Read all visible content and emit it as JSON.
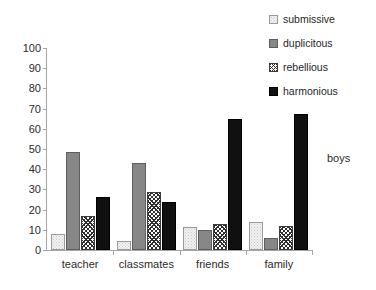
{
  "chart_data": {
    "type": "bar",
    "title": "",
    "xlabel": "",
    "ylabel": "",
    "ylim": [
      0,
      100
    ],
    "yticks": [
      0,
      10,
      20,
      30,
      40,
      50,
      60,
      70,
      80,
      90,
      100
    ],
    "grid": false,
    "legend_position": "top-right",
    "annotation": "boys",
    "categories": [
      "teacher",
      "classmates",
      "friends",
      "family"
    ],
    "series": [
      {
        "name": "submissive",
        "values": [
          8,
          4.5,
          11.5,
          14
        ],
        "color": "#f2f2f2",
        "pattern": "dotted"
      },
      {
        "name": "duplicitous",
        "values": [
          48.5,
          43,
          10,
          6
        ],
        "color": "#878787",
        "pattern": "solid"
      },
      {
        "name": "rebellious",
        "values": [
          17,
          28.5,
          13,
          12
        ],
        "color": "#ffffff",
        "pattern": "crosshatch"
      },
      {
        "name": "harmonious",
        "values": [
          26,
          24,
          65,
          67.5
        ],
        "color": "#101010",
        "pattern": "solid"
      }
    ]
  },
  "legend": {
    "items": [
      {
        "label": "submissive"
      },
      {
        "label": "duplicitous"
      },
      {
        "label": "rebellious"
      },
      {
        "label": "harmonious"
      }
    ]
  },
  "axis": {
    "y_tick_labels": [
      "100",
      "90",
      "80",
      "70",
      "60",
      "50",
      "40",
      "30",
      "20",
      "10",
      "0"
    ]
  }
}
